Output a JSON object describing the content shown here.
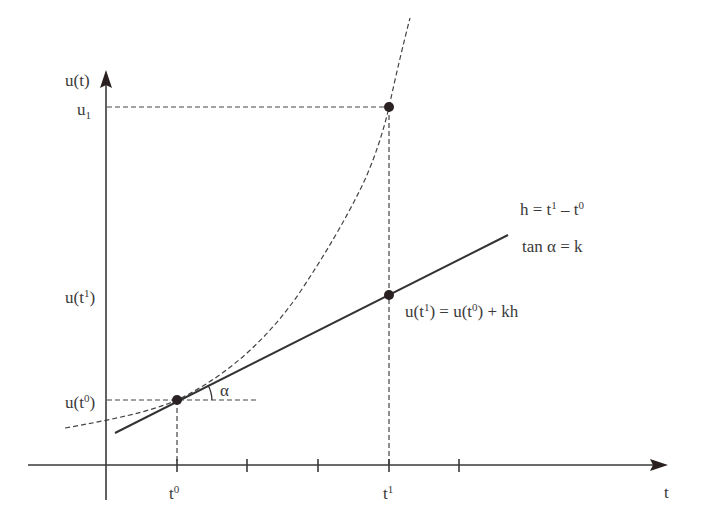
{
  "diagram": {
    "axes": {
      "y_label": "u(t)",
      "x_label": "t",
      "color": "#3a3a3a"
    },
    "y_ticks": {
      "u1": "u",
      "u1_sub": "1",
      "ut1": "u(t",
      "ut1_sup": "1",
      "ut1_close": ")",
      "ut0": "u(t",
      "ut0_sup": "0",
      "ut0_close": ")"
    },
    "x_ticks": {
      "t0": "t",
      "t0_sup": "0",
      "t1": "t",
      "t1_sup": "1"
    },
    "annotations": {
      "h_def_a": "h = t",
      "h_def_sup1": "1",
      "h_def_b": " – t",
      "h_def_sup0": "0",
      "tan_def": "tan α = k",
      "alpha": "α",
      "euler_a": "u(t",
      "euler_sup1": "1",
      "euler_b": ") = u(t",
      "euler_sup0": "0",
      "euler_c": ") + kh"
    },
    "elements": [
      {
        "name": "exact-solution-curve",
        "style": "dashed"
      },
      {
        "name": "tangent-line",
        "style": "solid",
        "slope_label": "k"
      },
      {
        "name": "point-t0",
        "label": "(t0, u(t0))"
      },
      {
        "name": "point-t1-euler",
        "label": "(t1, u(t1))"
      },
      {
        "name": "point-t1-exact",
        "label": "(t1, u1)"
      }
    ],
    "colors": {
      "ink": "#333333",
      "guide_start": "#4a5068",
      "guide_end": "#e8e070"
    }
  }
}
